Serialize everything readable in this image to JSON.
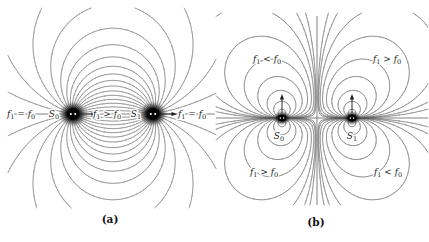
{
  "figure": {
    "background": "#ffffff",
    "line_color": "#585858",
    "text_color": "#1a1a1a",
    "panels": {
      "a": {
        "caption": "(a)",
        "type": "field-lines-of-two-sources",
        "sources": [
          {
            "name": "S0",
            "x": 73,
            "y": 114
          },
          {
            "name": "S1",
            "x": 153,
            "y": 114
          }
        ],
        "axis": {
          "x1": 9,
          "y1": 114,
          "x2": 215,
          "y2": 114
        },
        "arrows": [
          {
            "x1": 80,
            "y1": 114,
            "x2": 97,
            "y2": 114
          },
          {
            "x1": 160,
            "y1": 114,
            "x2": 177,
            "y2": 114
          }
        ],
        "labels": [
          {
            "name": "label-a-f-left",
            "text": "f_1 = f_0",
            "x": 21,
            "y": 117
          },
          {
            "name": "label-a-s0",
            "text": "S_0",
            "x": 54,
            "y": 117
          },
          {
            "name": "label-a-f-mid",
            "text": "f_1 > f_0",
            "x": 107,
            "y": 117
          },
          {
            "name": "label-a-s1",
            "text": "S_1",
            "x": 136,
            "y": 117
          },
          {
            "name": "label-a-f-right",
            "text": "f_1 = f_0",
            "x": 192,
            "y": 117
          }
        ],
        "render": {
          "bounds": [
            8,
            8,
            216,
            208
          ],
          "cell": 2,
          "n_angles": 18,
          "blob": {
            "rx": 15,
            "ry": 13,
            "core_rx": 5.5,
            "core_ry": 6,
            "dot_r": 1.1,
            "dot_off": 2.2
          }
        }
      },
      "b": {
        "caption": "(b)",
        "type": "frequency-shift-contours",
        "sources": [
          {
            "name": "S0",
            "x": 282,
            "y": 118,
            "arrow_dir": "up"
          },
          {
            "name": "S1",
            "x": 352,
            "y": 118,
            "arrow_dir": "up"
          }
        ],
        "axis_h": {
          "x1": 216,
          "y1": 118,
          "x2": 428,
          "y2": 118
        },
        "axis_v": {
          "x1": 317,
          "y1": 16,
          "x2": 317,
          "y2": 205
        },
        "arrows": [
          {
            "x1": 282,
            "y1": 113,
            "x2": 282,
            "y2": 94
          },
          {
            "x1": 352,
            "y1": 113,
            "x2": 352,
            "y2": 94
          }
        ],
        "labels": [
          {
            "name": "label-b-upper-left",
            "text": "f_1 < f_0",
            "x": 267,
            "y": 62
          },
          {
            "name": "label-b-upper-right",
            "text": "f_1 > f_0",
            "x": 387,
            "y": 62
          },
          {
            "name": "label-b-lower-left",
            "text": "f_1 > f_0",
            "x": 264,
            "y": 175
          },
          {
            "name": "label-b-lower-right",
            "text": "f_1 < f_0",
            "x": 388,
            "y": 175
          },
          {
            "name": "label-b-s0",
            "text": "S_0",
            "x": 279,
            "y": 139
          },
          {
            "name": "label-b-s1",
            "text": "S_1",
            "x": 352,
            "y": 139
          }
        ],
        "render": {
          "bounds": [
            216,
            13,
            428,
            205
          ],
          "cell": 2,
          "soften": 9,
          "levels": [
            0.1,
            0.055,
            0.031,
            0.018,
            0.0105,
            0.006,
            0.0034,
            0.0019,
            0.0011
          ],
          "blob": {
            "rx": 9,
            "ry": 7.5,
            "core_rx": 4,
            "core_ry": 3.2,
            "dot_r": 0.8,
            "dot_off": 1.6
          }
        }
      }
    }
  }
}
